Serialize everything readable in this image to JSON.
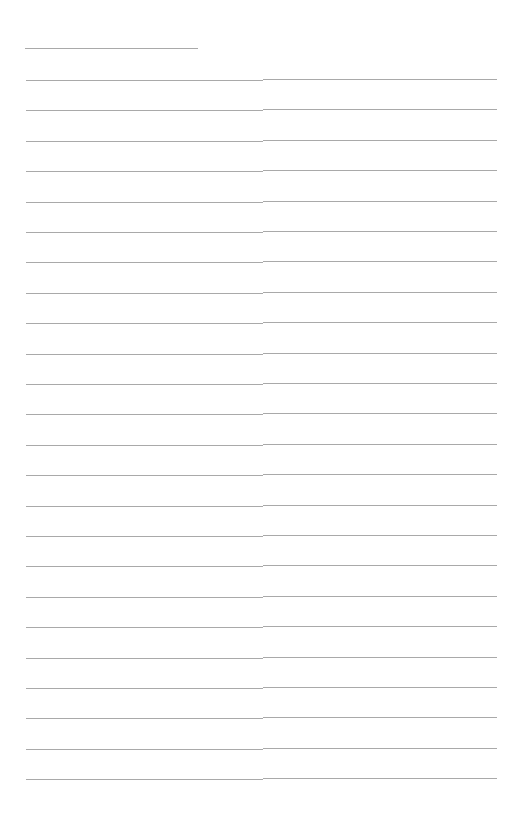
{
  "document": {
    "type": "ruled-notebook-page",
    "text_content": "",
    "line_color": "#a9a9a9",
    "background_color": "#ffffff",
    "header_line_count": 1,
    "ruled_line_count": 24
  }
}
